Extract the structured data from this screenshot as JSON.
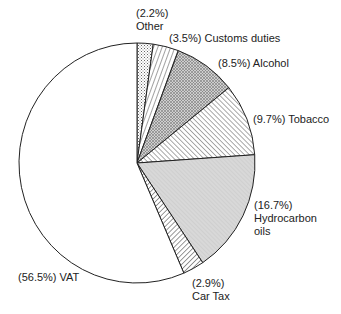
{
  "chart_data": {
    "type": "pie",
    "title": "",
    "start_angle_deg": 0,
    "direction": "clockwise",
    "slices": [
      {
        "label": "Other",
        "value": 2.2,
        "text": "(2.2%)",
        "text2": "Other",
        "pattern": "dots"
      },
      {
        "label": "Customs duties",
        "value": 3.5,
        "text": "(3.5%) Customs duties",
        "pattern": "hatch-steep"
      },
      {
        "label": "Alcohol",
        "value": 8.5,
        "text": "(8.5%) Alcohol",
        "pattern": "crosshatch"
      },
      {
        "label": "Tobacco",
        "value": 9.7,
        "text": "(9.7%) Tobacco",
        "pattern": "hatch-diag"
      },
      {
        "label": "Hydrocarbon oils",
        "value": 16.7,
        "text": "(16.7%)",
        "text2": "Hydrocarbon",
        "text3": "oils",
        "pattern": "grey-fine"
      },
      {
        "label": "Car Tax",
        "value": 2.9,
        "text": "(2.9%)",
        "text2": "Car Tax",
        "pattern": "hatch-back"
      },
      {
        "label": "VAT",
        "value": 56.5,
        "text": "(56.5%) VAT",
        "pattern": "none"
      }
    ]
  },
  "colors": {
    "stroke": "#222222",
    "fill": "#ffffff",
    "grey": "#d6d6d6"
  }
}
